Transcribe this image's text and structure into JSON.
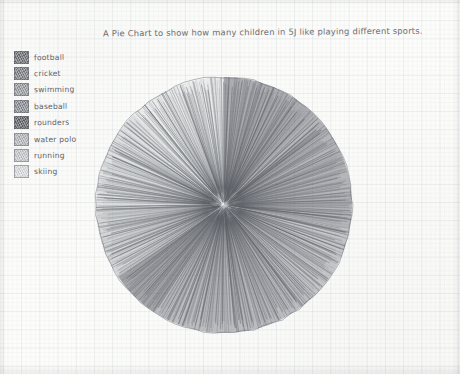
{
  "title": "A Pie Chart to show how many children in 5J like playing different sports.",
  "legend": {
    "items": [
      {
        "label": "football",
        "shade": "#6e7076"
      },
      {
        "label": "cricket",
        "shade": "#7d8086"
      },
      {
        "label": "swimming",
        "shade": "#9a9da3"
      },
      {
        "label": "baseball",
        "shade": "#8a8d93"
      },
      {
        "label": "rounders",
        "shade": "#5f6167"
      },
      {
        "label": "water polo",
        "shade": "#b6b9be"
      },
      {
        "label": "running",
        "shade": "#c9ccd0"
      },
      {
        "label": "skiing",
        "shade": "#dfe1e4"
      }
    ]
  },
  "chart_data": {
    "type": "pie",
    "title": "A Pie Chart to show how many children in 5J like playing different sports.",
    "xlabel": "",
    "ylabel": "",
    "legend_position": "left",
    "grid": true,
    "center": {
      "x": 128,
      "y": 128
    },
    "radius": 128,
    "categories": [
      "football",
      "cricket",
      "swimming",
      "baseball",
      "rounders",
      "water polo",
      "running",
      "skiing"
    ],
    "values": [
      4,
      5,
      3,
      7,
      2,
      3,
      4,
      4
    ],
    "slices": [
      {
        "label": "football",
        "value": 4,
        "percent": 12.5,
        "start_angle": 0,
        "end_angle": 45,
        "color": "#6e7076"
      },
      {
        "label": "cricket",
        "value": 5,
        "percent": 15.6,
        "start_angle": 45,
        "end_angle": 101,
        "color": "#7d8086"
      },
      {
        "label": "swimming",
        "value": 3,
        "percent": 9.4,
        "start_angle": 101,
        "end_angle": 135,
        "color": "#9a9da3"
      },
      {
        "label": "baseball",
        "value": 7,
        "percent": 21.9,
        "start_angle": 135,
        "end_angle": 213,
        "color": "#8a8d93"
      },
      {
        "label": "rounders",
        "value": 2,
        "percent": 6.3,
        "start_angle": 213,
        "end_angle": 236,
        "color": "#5f6167"
      },
      {
        "label": "water polo",
        "value": 3,
        "percent": 9.4,
        "start_angle": 236,
        "end_angle": 270,
        "color": "#b6b9be"
      },
      {
        "label": "running",
        "value": 4,
        "percent": 12.5,
        "start_angle": 270,
        "end_angle": 315,
        "color": "#c9ccd0"
      },
      {
        "label": "skiing",
        "value": 4,
        "percent": 12.5,
        "start_angle": 315,
        "end_angle": 360,
        "color": "#dfe1e4"
      }
    ]
  }
}
